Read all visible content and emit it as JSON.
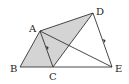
{
  "diagram": {
    "type": "geometry",
    "points": {
      "A": {
        "label": "A",
        "x": 40,
        "y": 31
      },
      "B": {
        "label": "B",
        "x": 20,
        "y": 67
      },
      "C": {
        "label": "C",
        "x": 53,
        "y": 67
      },
      "D": {
        "label": "D",
        "x": 93,
        "y": 13
      },
      "E": {
        "label": "E",
        "x": 112,
        "y": 67
      }
    },
    "segments": [
      "AB",
      "BC",
      "CE",
      "AD",
      "AC",
      "CD",
      "DE",
      "AE"
    ],
    "parallel_marks": [
      "AC",
      "DE"
    ],
    "shaded": [
      "ABC",
      "ACD"
    ],
    "colors": {
      "shade": "#d4d4d4",
      "line": "#333333"
    }
  }
}
